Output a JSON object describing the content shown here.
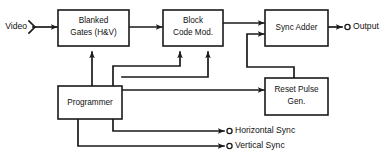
{
  "diagram": {
    "type": "block-diagram",
    "stroke_color": "#1a1a1a",
    "background_color": "#ffffff",
    "blocks": [
      {
        "id": "blanked-gates",
        "line1": "Blanked",
        "line2": "Gates (H&V)"
      },
      {
        "id": "block-code-mod",
        "line1": "Block",
        "line2": "Code Mod."
      },
      {
        "id": "sync-adder",
        "line1": "Sync Adder",
        "line2": ""
      },
      {
        "id": "reset-pulse-gen",
        "line1": "Reset Pulse",
        "line2": "Gen."
      },
      {
        "id": "programmer",
        "line1": "Programmer",
        "line2": ""
      }
    ],
    "terminals": [
      {
        "id": "video-input",
        "label": "Video",
        "side": "left"
      },
      {
        "id": "output",
        "label": "Output",
        "side": "right"
      },
      {
        "id": "horizontal-sync",
        "label": "Horizontal Sync",
        "side": "right"
      },
      {
        "id": "vertical-sync",
        "label": "Vertical Sync",
        "side": "right"
      }
    ]
  }
}
